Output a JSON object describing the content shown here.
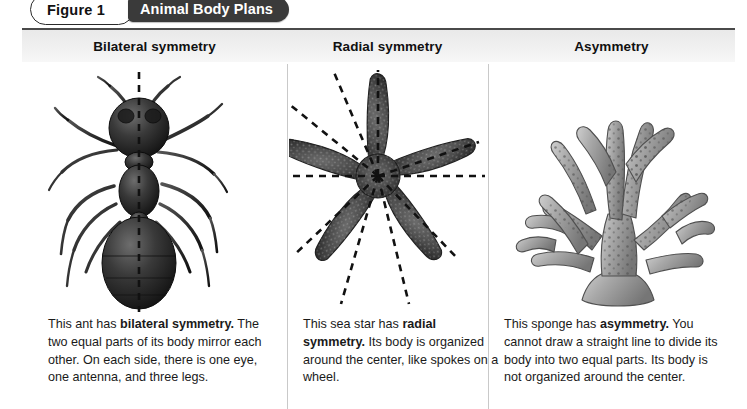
{
  "figure": {
    "number_label": "Figure 1",
    "title": "Animal Body Plans"
  },
  "colors": {
    "title_pill_bg": "#3a3a3a",
    "title_pill_text": "#ffffff",
    "header_band_bg": "#efefef",
    "header_rule": "#4a4a4a",
    "divider": "#c9c9c9",
    "body_text": "#1a1a1a",
    "page_bg": "#ffffff"
  },
  "columns": [
    {
      "header": "Bilateral symmetry",
      "organism": "ant",
      "symmetry_lines": 1,
      "caption": {
        "lead": "This ant has ",
        "term": "bilateral symmetry.",
        "rest": " The two equal parts of its body mirror each other. On each side, there is one eye, one antenna, and three legs."
      }
    },
    {
      "header": "Radial symmetry",
      "organism": "sea star",
      "symmetry_lines": 5,
      "caption": {
        "lead": "This sea star has ",
        "term": "radial symmetry.",
        "rest": " Its body is organized around the center, like spokes on a wheel."
      }
    },
    {
      "header": "Asymmetry",
      "organism": "sponge",
      "symmetry_lines": 0,
      "caption": {
        "lead": "This sponge has ",
        "term": "asymmetry.",
        "rest": " You cannot draw a straight line to divide its body into two equal parts. Its body is not organized around the center."
      }
    }
  ]
}
